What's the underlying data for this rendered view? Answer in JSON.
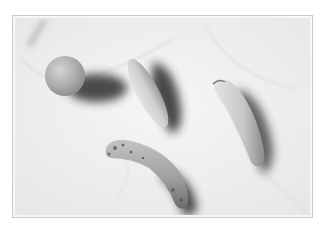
{
  "image": {
    "description": "Black-and-white still life photograph of fruit on a marble surface",
    "subjects": [
      "orange",
      "cucumber",
      "banana",
      "overripe-banana"
    ],
    "palette": {
      "background": "#ffffff",
      "frame_border": "#c9c9c9",
      "marble_light": "#f4f4f4",
      "marble_vein": "#c8c8c8",
      "fruit_mid": "#b3b3b3",
      "shadow": "#3a3a3a"
    }
  }
}
